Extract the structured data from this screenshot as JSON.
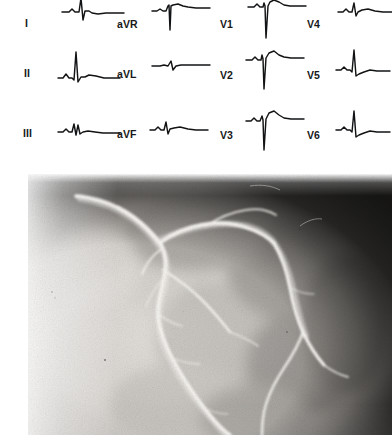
{
  "figure": {
    "kind": "medical-figure",
    "panels": [
      "ecg-12-lead",
      "coronary-angiogram"
    ]
  },
  "ecg": {
    "columns": [
      {
        "name": "limb-leads",
        "leads": [
          "I",
          "II",
          "III"
        ]
      },
      {
        "name": "augmented-limb-leads",
        "leads": [
          "aVR",
          "aVL",
          "aVF"
        ]
      },
      {
        "name": "precordial-right",
        "leads": [
          "V1",
          "V2",
          "V3"
        ]
      },
      {
        "name": "precordial-left",
        "leads": [
          "V4",
          "V5",
          "V6"
        ]
      }
    ],
    "leads": [
      {
        "label": "I",
        "label_x": 25,
        "label_y": 18,
        "trace_x": 62,
        "trace_y": -14,
        "col": 0,
        "row": 0,
        "morphology": "low-amplitude rS with flat ST segment, partially cropped at top of frame"
      },
      {
        "label": "II",
        "label_x": 24,
        "label_y": 68,
        "trace_x": 58,
        "trace_y": 44,
        "col": 0,
        "row": 1,
        "morphology": "tall narrow R wave, upright T"
      },
      {
        "label": "III",
        "label_x": 23,
        "label_y": 128,
        "trace_x": 58,
        "trace_y": 104,
        "col": 0,
        "row": 2,
        "morphology": "small rS, low amplitude, slightly notched"
      },
      {
        "label": "aVR",
        "label_x": 117,
        "label_y": 19,
        "trace_x": 152,
        "trace_y": -6,
        "col": 1,
        "row": 0,
        "morphology": "deep negative QS complex with inverted T"
      },
      {
        "label": "aVL",
        "label_x": 117,
        "label_y": 69,
        "trace_x": 152,
        "trace_y": 48,
        "col": 1,
        "row": 1,
        "morphology": "very low amplitude, nearly isoelectric"
      },
      {
        "label": "aVF",
        "label_x": 117,
        "label_y": 129,
        "trace_x": 150,
        "trace_y": 108,
        "col": 1,
        "row": 2,
        "morphology": "small R wave with upright T"
      },
      {
        "label": "V1",
        "label_x": 220,
        "label_y": 19,
        "trace_x": 248,
        "trace_y": -6,
        "col": 2,
        "row": 0,
        "morphology": "deep S wave with marked ST elevation and coved T"
      },
      {
        "label": "V2",
        "label_x": 220,
        "label_y": 70,
        "trace_x": 246,
        "trace_y": 44,
        "col": 2,
        "row": 1,
        "morphology": "deep S wave with pronounced ST elevation"
      },
      {
        "label": "V3",
        "label_x": 220,
        "label_y": 130,
        "trace_x": 246,
        "trace_y": 104,
        "col": 2,
        "row": 2,
        "morphology": "deep S wave with pronounced ST elevation"
      },
      {
        "label": "V4",
        "label_x": 307,
        "label_y": 19,
        "trace_x": 338,
        "trace_y": -10,
        "col": 3,
        "row": 0,
        "morphology": "rS transitioning, small R, upright T"
      },
      {
        "label": "V5",
        "label_x": 307,
        "label_y": 70,
        "trace_x": 336,
        "trace_y": 44,
        "col": 3,
        "row": 1,
        "morphology": "tall R wave with small S"
      },
      {
        "label": "V6",
        "label_x": 307,
        "label_y": 130,
        "trace_x": 336,
        "trace_y": 104,
        "col": 3,
        "row": 2,
        "morphology": "tall R wave with small S and upright T"
      }
    ]
  },
  "angiogram": {
    "modality": "coronary angiography",
    "view": "left coronary artery injection",
    "appearance": "grainy black-and-white cine frame; bright contrast-filled vessels on a mottled grey myocardial background; dark curved image-intensifier border along the upper and right margins",
    "field": {
      "background_light": "#e9e7e4",
      "background_mid": "#b9b6b2",
      "background_dark": "#4a4845",
      "vessel_color": "#f6f4f0"
    },
    "vessels": [
      {
        "name": "left-main-coronary-artery",
        "abbr": "LM"
      },
      {
        "name": "left-anterior-descending-artery",
        "abbr": "LAD"
      },
      {
        "name": "diagonal-branch",
        "abbr": "D1"
      },
      {
        "name": "left-circumflex-artery",
        "abbr": "LCx"
      },
      {
        "name": "obtuse-marginal-branch",
        "abbr": "OM"
      }
    ]
  }
}
